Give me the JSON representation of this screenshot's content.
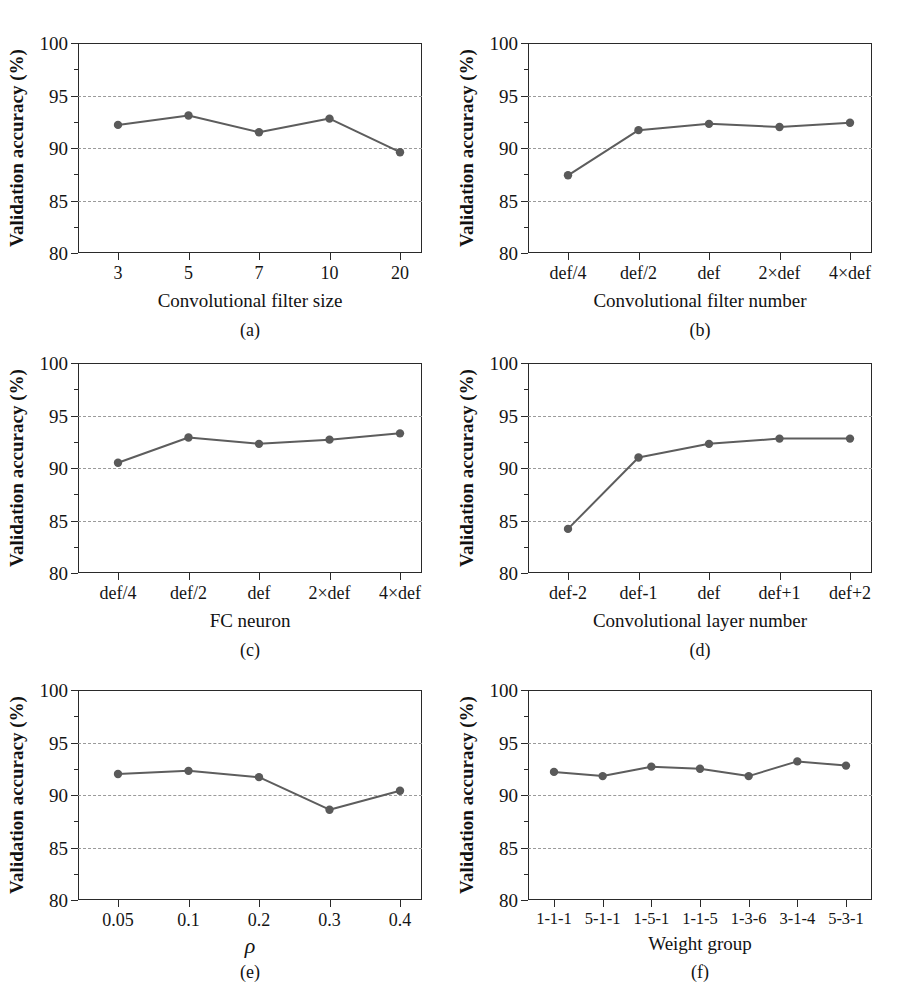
{
  "figure": {
    "shared_ylabel": "Validation accuracy (%)",
    "y_ticks": [
      "80",
      "85",
      "90",
      "95",
      "100"
    ],
    "line_color": "#5d5d5d",
    "marker_color": "#5a5a5a",
    "grid_color": "#9a9a9a",
    "axis_color": "#2a2a2a"
  },
  "chart_data": [
    {
      "type": "line",
      "panel": "(a)",
      "title": "",
      "xlabel": "Convolutional filter size",
      "ylabel": "Validation accuracy (%)",
      "categories": [
        "3",
        "5",
        "7",
        "10",
        "20"
      ],
      "values": [
        92.2,
        93.1,
        91.5,
        92.8,
        89.6
      ],
      "ylim": [
        80,
        100
      ],
      "yticks": [
        80,
        85,
        90,
        95,
        100
      ],
      "grid": "horizontal-dashed",
      "legend": "none"
    },
    {
      "type": "line",
      "panel": "(b)",
      "title": "",
      "xlabel": "Convolutional filter number",
      "ylabel": "Validation accuracy (%)",
      "categories": [
        "def/4",
        "def/2",
        "def",
        "2×def",
        "4×def"
      ],
      "values": [
        87.4,
        91.7,
        92.3,
        92.0,
        92.4
      ],
      "ylim": [
        80,
        100
      ],
      "yticks": [
        80,
        85,
        90,
        95,
        100
      ],
      "grid": "horizontal-dashed",
      "legend": "none"
    },
    {
      "type": "line",
      "panel": "(c)",
      "title": "",
      "xlabel": "FC neuron",
      "ylabel": "Validation accuracy (%)",
      "categories": [
        "def/4",
        "def/2",
        "def",
        "2×def",
        "4×def"
      ],
      "values": [
        90.5,
        92.9,
        92.3,
        92.7,
        93.3
      ],
      "ylim": [
        80,
        100
      ],
      "yticks": [
        80,
        85,
        90,
        95,
        100
      ],
      "grid": "horizontal-dashed",
      "legend": "none"
    },
    {
      "type": "line",
      "panel": "(d)",
      "title": "",
      "xlabel": "Convolutional layer number",
      "ylabel": "Validation accuracy (%)",
      "categories": [
        "def-2",
        "def-1",
        "def",
        "def+1",
        "def+2"
      ],
      "values": [
        84.2,
        91.0,
        92.3,
        92.8,
        92.8
      ],
      "ylim": [
        80,
        100
      ],
      "yticks": [
        80,
        85,
        90,
        95,
        100
      ],
      "grid": "horizontal-dashed",
      "legend": "none"
    },
    {
      "type": "line",
      "panel": "(e)",
      "title": "",
      "xlabel": "ρ",
      "ylabel": "Validation accuracy (%)",
      "categories": [
        "0.05",
        "0.1",
        "0.2",
        "0.3",
        "0.4"
      ],
      "values": [
        92.0,
        92.3,
        91.7,
        88.6,
        90.4
      ],
      "ylim": [
        80,
        100
      ],
      "yticks": [
        80,
        85,
        90,
        95,
        100
      ],
      "grid": "horizontal-dashed",
      "legend": "none"
    },
    {
      "type": "line",
      "panel": "(f)",
      "title": "",
      "xlabel": "Weight group",
      "ylabel": "Validation accuracy (%)",
      "categories": [
        "1-1-1",
        "5-1-1",
        "1-5-1",
        "1-1-5",
        "1-3-6",
        "3-1-4",
        "5-3-1"
      ],
      "values": [
        92.2,
        91.8,
        92.7,
        92.5,
        91.8,
        93.2,
        92.8
      ],
      "ylim": [
        80,
        100
      ],
      "yticks": [
        80,
        85,
        90,
        95,
        100
      ],
      "grid": "horizontal-dashed",
      "legend": "none"
    }
  ]
}
